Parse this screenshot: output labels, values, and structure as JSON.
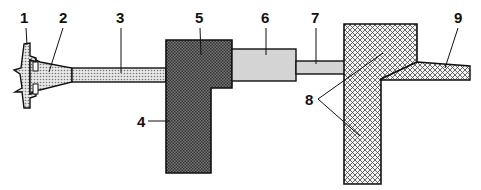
{
  "diagram": {
    "type": "cross-section schematic",
    "labels": [
      {
        "id": "1",
        "text": "1",
        "x": 20,
        "y": 10
      },
      {
        "id": "2",
        "text": "2",
        "x": 59,
        "y": 10
      },
      {
        "id": "3",
        "text": "3",
        "x": 116,
        "y": 10
      },
      {
        "id": "4",
        "text": "4",
        "x": 137,
        "y": 116
      },
      {
        "id": "5",
        "text": "5",
        "x": 195,
        "y": 10
      },
      {
        "id": "6",
        "text": "6",
        "x": 260,
        "y": 10
      },
      {
        "id": "7",
        "text": "7",
        "x": 310,
        "y": 10
      },
      {
        "id": "8",
        "text": "8",
        "x": 305,
        "y": 94
      },
      {
        "id": "9",
        "text": "9",
        "x": 454,
        "y": 10
      }
    ],
    "colors": {
      "stroke": "#111111",
      "light_fill": "#d8d8d8",
      "dot_fill": "#c8c8c8",
      "dark_fill": "#555555",
      "crosshatch_fill": "#e6e6e6"
    }
  }
}
